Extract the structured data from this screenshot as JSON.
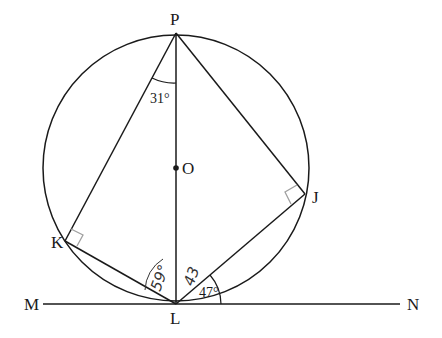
{
  "diagram": {
    "points": {
      "P": {
        "label": "P",
        "x": 176,
        "y": 33
      },
      "O": {
        "label": "O",
        "x": 176,
        "y": 168
      },
      "L": {
        "label": "L",
        "x": 176,
        "y": 304
      },
      "K": {
        "label": "K",
        "x": 65,
        "y": 241
      },
      "J": {
        "label": "J",
        "x": 305,
        "y": 194
      },
      "M": {
        "label": "M",
        "x": 43,
        "y": 304
      },
      "N": {
        "label": "N",
        "x": 400,
        "y": 304
      }
    },
    "circle": {
      "center": "O",
      "radius": 133
    },
    "tangent_line": "MN",
    "segments": [
      "PL",
      "PK",
      "PJ",
      "KL",
      "JL"
    ],
    "right_angle_markers": [
      "K",
      "J"
    ],
    "angles": {
      "KPL": "31°",
      "JLN": "47°",
      "KLP_handwritten": "59°",
      "PLJ_handwritten": "43"
    },
    "colors": {
      "line": "#1a1a1a",
      "right_angle_marker": "#a0a0a0",
      "background": "#ffffff"
    }
  }
}
